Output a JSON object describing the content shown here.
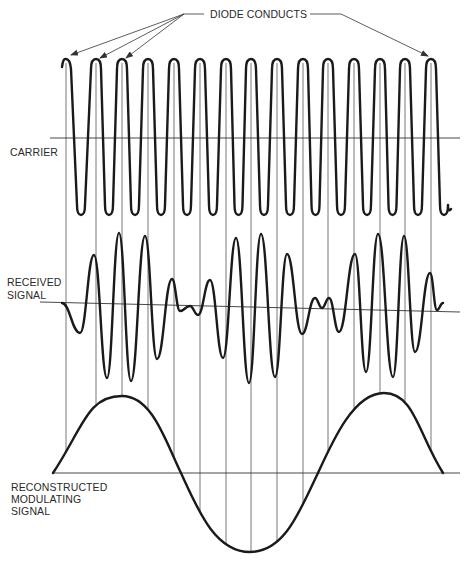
{
  "labels": {
    "diode_conducts": "DIODE CONDUCTS",
    "carrier": "CARRIER",
    "received_signal": "RECEIVED\nSIGNAL",
    "reconstructed_signal": "RECONSTRUCTED\nMODULATING\nSIGNAL"
  },
  "colors": {
    "ink": "#1a1a1a",
    "thin_line": "#555555",
    "background": "#ffffff"
  },
  "carrier": {
    "baseline_y": 138,
    "peak_y": 59,
    "trough_y": 215,
    "peak_x": [
      66,
      96,
      122,
      148,
      174,
      200,
      226,
      251,
      277,
      303,
      328,
      354,
      380,
      405,
      431
    ]
  },
  "received": {
    "baseline": {
      "x1": 40,
      "y1": 302,
      "x2": 460,
      "y2": 312
    },
    "points": [
      [
        62,
        303
      ],
      [
        80,
        333
      ],
      [
        94,
        255
      ],
      [
        107,
        378
      ],
      [
        119,
        233
      ],
      [
        131,
        381
      ],
      [
        145,
        236
      ],
      [
        157,
        359
      ],
      [
        172,
        279
      ],
      [
        180,
        311
      ],
      [
        190,
        306
      ],
      [
        198,
        315
      ],
      [
        210,
        280
      ],
      [
        223,
        358
      ],
      [
        236,
        238
      ],
      [
        249,
        383
      ],
      [
        261,
        234
      ],
      [
        275,
        377
      ],
      [
        287,
        254
      ],
      [
        302,
        334
      ],
      [
        315,
        298
      ],
      [
        322,
        308
      ],
      [
        329,
        298
      ],
      [
        339,
        332
      ],
      [
        355,
        254
      ],
      [
        366,
        372
      ],
      [
        378,
        234
      ],
      [
        393,
        377
      ],
      [
        404,
        236
      ],
      [
        415,
        352
      ],
      [
        430,
        273
      ],
      [
        437,
        310
      ],
      [
        443,
        303
      ]
    ]
  },
  "modulating": {
    "baseline_y": 473,
    "start_x": 53,
    "end_x": 443,
    "peak1": [
      122,
      396
    ],
    "trough": [
      250,
      552
    ],
    "peak2": [
      384,
      393
    ]
  },
  "arrows": {
    "origin": [
      184,
      14
    ],
    "targets_left": [
      [
        71,
        55
      ],
      [
        100,
        58
      ],
      [
        126,
        58
      ]
    ],
    "right_line": [
      [
        310,
        14
      ],
      [
        341,
        14
      ],
      [
        428,
        56
      ]
    ]
  }
}
